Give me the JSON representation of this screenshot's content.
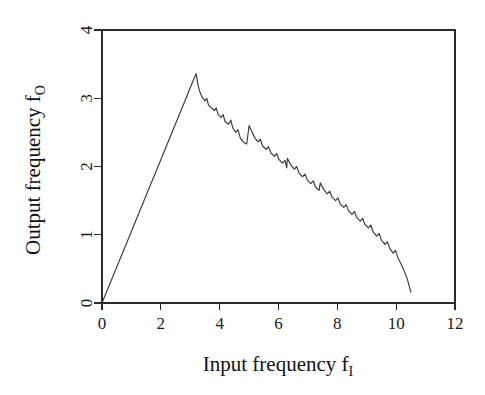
{
  "chart_data": {
    "type": "line",
    "title": "",
    "subtitle": "",
    "xlabel": "Input frequency  f",
    "xlabel_sub": "I",
    "ylabel": "Output frequency  f",
    "ylabel_sub": "O",
    "xlim": [
      0,
      12
    ],
    "ylim": [
      0,
      4
    ],
    "xticks": [
      0,
      2,
      4,
      6,
      8,
      10,
      12
    ],
    "xtick_labels": [
      "0",
      "2",
      "4",
      "6",
      "8",
      "10",
      "12"
    ],
    "yticks": [
      0,
      1,
      2,
      3,
      4
    ],
    "ytick_labels": [
      "0",
      "1",
      "2",
      "3",
      "4"
    ],
    "grid": false,
    "legend": "none",
    "series": [
      {
        "name": "frequency response",
        "description": "Linear rise from origin to peak, then descending devil's-staircase with sawtooth steps, ending with a steep drop.",
        "points": [
          [
            0.0,
            0.0
          ],
          [
            0.4,
            0.42
          ],
          [
            0.8,
            0.84
          ],
          [
            1.2,
            1.26
          ],
          [
            1.6,
            1.68
          ],
          [
            2.0,
            2.1
          ],
          [
            2.4,
            2.52
          ],
          [
            2.8,
            2.94
          ],
          [
            3.1,
            3.26
          ],
          [
            3.2,
            3.36
          ],
          [
            3.26,
            3.2
          ],
          [
            3.32,
            3.1
          ],
          [
            3.4,
            3.02
          ],
          [
            3.5,
            2.96
          ],
          [
            3.56,
            3.0
          ],
          [
            3.62,
            2.9
          ],
          [
            3.72,
            2.86
          ],
          [
            3.82,
            2.82
          ],
          [
            3.88,
            2.86
          ],
          [
            3.95,
            2.76
          ],
          [
            4.05,
            2.72
          ],
          [
            4.12,
            2.76
          ],
          [
            4.18,
            2.66
          ],
          [
            4.3,
            2.62
          ],
          [
            4.38,
            2.68
          ],
          [
            4.45,
            2.56
          ],
          [
            4.55,
            2.5
          ],
          [
            4.62,
            2.54
          ],
          [
            4.7,
            2.42
          ],
          [
            4.8,
            2.36
          ],
          [
            4.92,
            2.33
          ],
          [
            5.0,
            2.6
          ],
          [
            5.1,
            2.5
          ],
          [
            5.2,
            2.42
          ],
          [
            5.3,
            2.36
          ],
          [
            5.38,
            2.4
          ],
          [
            5.46,
            2.3
          ],
          [
            5.58,
            2.25
          ],
          [
            5.66,
            2.29
          ],
          [
            5.74,
            2.2
          ],
          [
            5.86,
            2.15
          ],
          [
            5.94,
            2.19
          ],
          [
            6.02,
            2.1
          ],
          [
            6.14,
            2.05
          ],
          [
            6.22,
            2.09
          ],
          [
            6.28,
            1.98
          ],
          [
            6.3,
            2.12
          ],
          [
            6.42,
            2.02
          ],
          [
            6.54,
            1.96
          ],
          [
            6.62,
            2.0
          ],
          [
            6.7,
            1.9
          ],
          [
            6.82,
            1.85
          ],
          [
            6.9,
            1.89
          ],
          [
            6.98,
            1.8
          ],
          [
            7.1,
            1.75
          ],
          [
            7.18,
            1.79
          ],
          [
            7.26,
            1.7
          ],
          [
            7.38,
            1.65
          ],
          [
            7.42,
            1.76
          ],
          [
            7.54,
            1.66
          ],
          [
            7.66,
            1.6
          ],
          [
            7.74,
            1.64
          ],
          [
            7.82,
            1.55
          ],
          [
            7.94,
            1.5
          ],
          [
            8.02,
            1.54
          ],
          [
            8.1,
            1.45
          ],
          [
            8.22,
            1.4
          ],
          [
            8.3,
            1.44
          ],
          [
            8.38,
            1.35
          ],
          [
            8.5,
            1.3
          ],
          [
            8.58,
            1.34
          ],
          [
            8.66,
            1.25
          ],
          [
            8.78,
            1.2
          ],
          [
            8.86,
            1.24
          ],
          [
            8.94,
            1.15
          ],
          [
            9.06,
            1.1
          ],
          [
            9.14,
            1.14
          ],
          [
            9.22,
            1.04
          ],
          [
            9.34,
            0.98
          ],
          [
            9.42,
            1.02
          ],
          [
            9.5,
            0.92
          ],
          [
            9.62,
            0.86
          ],
          [
            9.7,
            0.9
          ],
          [
            9.78,
            0.8
          ],
          [
            9.9,
            0.73
          ],
          [
            9.98,
            0.77
          ],
          [
            10.06,
            0.66
          ],
          [
            10.16,
            0.58
          ],
          [
            10.24,
            0.5
          ],
          [
            10.32,
            0.42
          ],
          [
            10.4,
            0.32
          ],
          [
            10.46,
            0.22
          ],
          [
            10.5,
            0.16
          ]
        ]
      }
    ]
  },
  "axes": {
    "x_axis_name": "Input frequency",
    "y_axis_name": "Output frequency"
  }
}
